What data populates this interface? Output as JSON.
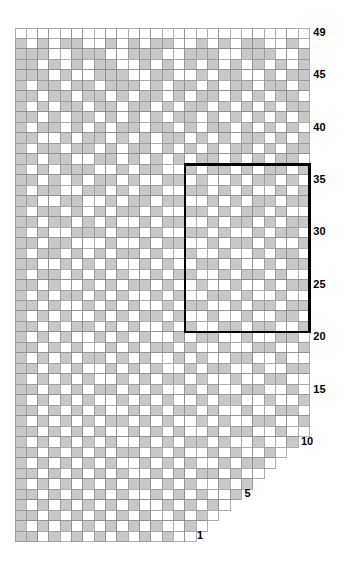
{
  "chart": {
    "title": "",
    "type": "knitting-colorwork-chart",
    "legend": {
      "filled_color": "#c8c8c8",
      "empty_color": "#ffffff",
      "grid_line_color": "#8c8c8c",
      "repeat_box_color": "#000000"
    },
    "geometry": {
      "origin_x": 15,
      "origin_y": 28,
      "cell_w": 11.32,
      "cell_h": 10.48,
      "columns": 26,
      "rows": 49
    },
    "row_labels": [
      {
        "row": 49,
        "text": "49"
      },
      {
        "row": 45,
        "text": "45"
      },
      {
        "row": 40,
        "text": "40"
      },
      {
        "row": 35,
        "text": "35"
      },
      {
        "row": 30,
        "text": "30"
      },
      {
        "row": 25,
        "text": "25"
      },
      {
        "row": 20,
        "text": "20"
      },
      {
        "row": 15,
        "text": "15"
      },
      {
        "row": 10,
        "text": "10"
      },
      {
        "row": 5,
        "text": "5"
      },
      {
        "row": 1,
        "text": "1"
      }
    ],
    "repeat_box": {
      "col_start": 16,
      "col_end": 26,
      "row_start": 21,
      "row_end": 36
    },
    "rows_data": [
      {
        "row": 49,
        "col_start": 1,
        "col_end": 26,
        "filled": []
      },
      {
        "row": 48,
        "col_start": 1,
        "col_end": 26,
        "filled": [
          1,
          3,
          5,
          6,
          9,
          11,
          13,
          14,
          17,
          19,
          21,
          22,
          25
        ]
      },
      {
        "row": 47,
        "col_start": 1,
        "col_end": 26,
        "filled": [
          1,
          2,
          3,
          6,
          7,
          8,
          11,
          12,
          13,
          16,
          17,
          18,
          21,
          22,
          23,
          26
        ]
      },
      {
        "row": 46,
        "col_start": 1,
        "col_end": 26,
        "filled": [
          1,
          2,
          4,
          6,
          8,
          9,
          12,
          14,
          16,
          18,
          20,
          22,
          24,
          26
        ]
      },
      {
        "row": 45,
        "col_start": 1,
        "col_end": 26,
        "filled": [
          1,
          2,
          3,
          5,
          8,
          9,
          10,
          13,
          14,
          17,
          19,
          20,
          23,
          25,
          26
        ]
      },
      {
        "row": 44,
        "col_start": 1,
        "col_end": 26,
        "filled": [
          1,
          3,
          4,
          6,
          7,
          9,
          10,
          11,
          13,
          15,
          16,
          18,
          20,
          21,
          23,
          24,
          26
        ]
      },
      {
        "row": 43,
        "col_start": 1,
        "col_end": 26,
        "filled": [
          1,
          2,
          4,
          5,
          7,
          8,
          10,
          12,
          13,
          15,
          17,
          18,
          20,
          22,
          24,
          25
        ]
      },
      {
        "row": 42,
        "col_start": 1,
        "col_end": 26,
        "filled": [
          1,
          3,
          5,
          6,
          8,
          9,
          11,
          12,
          14,
          16,
          17,
          19,
          21,
          23,
          25,
          26
        ]
      },
      {
        "row": 41,
        "col_start": 1,
        "col_end": 26,
        "filled": [
          1,
          2,
          4,
          6,
          7,
          9,
          11,
          13,
          15,
          16,
          18,
          20,
          22,
          24,
          26
        ]
      },
      {
        "row": 40,
        "col_start": 1,
        "col_end": 26,
        "filled": [
          1,
          3,
          4,
          6,
          8,
          10,
          11,
          13,
          14,
          16,
          18,
          19,
          21,
          23,
          25
        ]
      },
      {
        "row": 39,
        "col_start": 1,
        "col_end": 26,
        "filled": [
          1,
          2,
          5,
          7,
          8,
          10,
          12,
          14,
          15,
          17,
          19,
          21,
          22,
          24,
          26
        ]
      },
      {
        "row": 38,
        "col_start": 1,
        "col_end": 26,
        "filled": [
          1,
          3,
          4,
          6,
          7,
          9,
          11,
          12,
          14,
          16,
          18,
          20,
          21,
          23,
          25,
          26
        ]
      },
      {
        "row": 37,
        "col_start": 1,
        "col_end": 26,
        "filled": [
          1,
          2,
          4,
          5,
          8,
          9,
          11,
          13,
          15,
          17,
          18,
          20,
          22,
          24,
          25
        ]
      },
      {
        "row": 36,
        "col_start": 1,
        "col_end": 26,
        "filled": [
          1,
          3,
          5,
          6,
          7,
          10,
          12,
          13,
          16,
          18,
          19,
          21,
          23,
          24,
          26
        ]
      },
      {
        "row": 35,
        "col_start": 1,
        "col_end": 26,
        "filled": [
          1,
          2,
          4,
          6,
          8,
          9,
          11,
          14,
          15,
          17,
          20,
          22,
          23,
          25
        ]
      },
      {
        "row": 34,
        "col_start": 1,
        "col_end": 26,
        "filled": [
          1,
          3,
          4,
          7,
          8,
          10,
          12,
          13,
          16,
          17,
          19,
          21,
          24,
          26
        ]
      },
      {
        "row": 33,
        "col_start": 1,
        "col_end": 26,
        "filled": [
          1,
          2,
          5,
          6,
          9,
          11,
          12,
          14,
          15,
          18,
          20,
          22,
          23,
          25,
          26
        ]
      },
      {
        "row": 32,
        "col_start": 1,
        "col_end": 26,
        "filled": [
          1,
          3,
          4,
          6,
          8,
          10,
          11,
          13,
          16,
          17,
          19,
          21,
          22,
          24
        ]
      },
      {
        "row": 31,
        "col_start": 1,
        "col_end": 26,
        "filled": [
          1,
          2,
          4,
          5,
          7,
          9,
          12,
          14,
          15,
          18,
          20,
          21,
          23,
          25,
          26
        ]
      },
      {
        "row": 30,
        "col_start": 1,
        "col_end": 26,
        "filled": [
          1,
          3,
          6,
          7,
          8,
          10,
          11,
          13,
          16,
          17,
          19,
          22,
          24,
          25
        ]
      },
      {
        "row": 29,
        "col_start": 1,
        "col_end": 26,
        "filled": [
          1,
          2,
          4,
          5,
          9,
          12,
          14,
          15,
          18,
          20,
          21,
          23,
          26
        ]
      },
      {
        "row": 28,
        "col_start": 1,
        "col_end": 26,
        "filled": [
          1,
          3,
          4,
          6,
          8,
          10,
          11,
          13,
          16,
          19,
          22,
          24,
          25
        ]
      },
      {
        "row": 27,
        "col_start": 1,
        "col_end": 26,
        "filled": [
          1,
          2,
          5,
          7,
          9,
          12,
          14,
          17,
          18,
          20,
          23,
          25,
          26
        ]
      },
      {
        "row": 26,
        "col_start": 1,
        "col_end": 26,
        "filled": [
          1,
          3,
          4,
          6,
          8,
          10,
          13,
          15,
          16,
          19,
          21,
          22,
          24
        ]
      },
      {
        "row": 25,
        "col_start": 1,
        "col_end": 26,
        "filled": [
          1,
          2,
          4,
          7,
          9,
          11,
          12,
          14,
          17,
          20,
          23,
          25,
          26
        ]
      },
      {
        "row": 24,
        "col_start": 1,
        "col_end": 26,
        "filled": [
          1,
          3,
          5,
          6,
          8,
          10,
          13,
          15,
          18,
          19,
          21,
          24
        ]
      },
      {
        "row": 23,
        "col_start": 1,
        "col_end": 26,
        "filled": [
          1,
          2,
          4,
          7,
          9,
          11,
          14,
          16,
          17,
          20,
          22,
          23,
          25,
          26
        ]
      },
      {
        "row": 22,
        "col_start": 1,
        "col_end": 26,
        "filled": [
          1,
          3,
          5,
          8,
          10,
          12,
          13,
          15,
          18,
          21,
          24,
          25
        ]
      },
      {
        "row": 21,
        "col_start": 1,
        "col_end": 26,
        "filled": [
          1,
          2,
          4,
          6,
          7,
          9,
          11,
          14,
          16,
          19,
          20,
          22,
          23,
          26
        ]
      },
      {
        "row": 20,
        "col_start": 1,
        "col_end": 26,
        "filled": [
          1,
          3,
          5,
          8,
          10,
          12,
          15,
          17,
          18,
          21,
          24,
          25
        ]
      },
      {
        "row": 19,
        "col_start": 1,
        "col_end": 26,
        "filled": [
          1,
          2,
          4,
          6,
          9,
          11,
          13,
          14,
          16,
          19,
          22,
          23,
          26
        ]
      },
      {
        "row": 18,
        "col_start": 1,
        "col_end": 26,
        "filled": [
          1,
          3,
          5,
          7,
          8,
          10,
          12,
          15,
          17,
          20,
          21,
          24
        ]
      },
      {
        "row": 17,
        "col_start": 1,
        "col_end": 26,
        "filled": [
          1,
          2,
          4,
          6,
          9,
          11,
          13,
          16,
          18,
          19,
          22,
          25,
          26
        ]
      },
      {
        "row": 16,
        "col_start": 1,
        "col_end": 26,
        "filled": [
          1,
          3,
          5,
          7,
          10,
          12,
          14,
          15,
          17,
          20,
          23,
          24
        ]
      },
      {
        "row": 15,
        "col_start": 1,
        "col_end": 26,
        "filled": [
          1,
          2,
          4,
          6,
          8,
          9,
          11,
          13,
          16,
          18,
          21,
          22,
          25
        ]
      },
      {
        "row": 14,
        "col_start": 1,
        "col_end": 26,
        "filled": [
          1,
          3,
          5,
          7,
          10,
          12,
          14,
          17,
          19,
          20,
          23,
          26
        ]
      },
      {
        "row": 13,
        "col_start": 1,
        "col_end": 26,
        "filled": [
          1,
          2,
          4,
          6,
          8,
          11,
          13,
          15,
          16,
          18,
          21,
          24,
          25
        ]
      },
      {
        "row": 12,
        "col_start": 1,
        "col_end": 26,
        "filled": [
          1,
          3,
          5,
          7,
          9,
          10,
          12,
          14,
          17,
          19,
          22,
          23,
          26
        ]
      },
      {
        "row": 11,
        "col_start": 1,
        "col_end": 26,
        "filled": [
          1,
          2,
          4,
          6,
          8,
          11,
          13,
          15,
          18,
          20,
          21,
          24
        ]
      },
      {
        "row": 10,
        "col_start": 1,
        "col_end": 25,
        "filled": [
          1,
          3,
          5,
          7,
          9,
          12,
          14,
          16,
          17,
          19,
          22,
          25
        ]
      },
      {
        "row": 9,
        "col_start": 1,
        "col_end": 24,
        "filled": [
          1,
          2,
          4,
          6,
          8,
          10,
          11,
          13,
          15,
          18,
          20,
          23
        ]
      },
      {
        "row": 8,
        "col_start": 1,
        "col_end": 23,
        "filled": [
          1,
          3,
          5,
          7,
          9,
          12,
          14,
          16,
          19,
          21,
          22
        ]
      },
      {
        "row": 7,
        "col_start": 1,
        "col_end": 22,
        "filled": [
          1,
          2,
          4,
          6,
          8,
          10,
          13,
          15,
          17,
          18,
          20
        ]
      },
      {
        "row": 6,
        "col_start": 1,
        "col_end": 21,
        "filled": [
          1,
          3,
          5,
          7,
          9,
          11,
          12,
          14,
          16,
          19,
          21
        ]
      },
      {
        "row": 5,
        "col_start": 1,
        "col_end": 20,
        "filled": [
          1,
          2,
          4,
          6,
          8,
          10,
          13,
          15,
          17,
          20
        ]
      },
      {
        "row": 4,
        "col_start": 1,
        "col_end": 19,
        "filled": [
          1,
          3,
          5,
          7,
          9,
          11,
          14,
          16,
          18
        ]
      },
      {
        "row": 3,
        "col_start": 1,
        "col_end": 18,
        "filled": [
          1,
          2,
          4,
          6,
          8,
          10,
          12,
          15,
          17
        ]
      },
      {
        "row": 2,
        "col_start": 1,
        "col_end": 17,
        "filled": [
          1,
          3,
          5,
          7,
          9,
          11,
          13,
          16
        ]
      },
      {
        "row": 1,
        "col_start": 1,
        "col_end": 16,
        "filled": [
          1,
          2,
          4,
          6,
          8,
          10,
          12,
          14
        ]
      }
    ],
    "left_border_rows": {
      "description": "three-stitch left edge column strip continuing to row 1",
      "col_start": 1,
      "col_end": 3
    }
  }
}
